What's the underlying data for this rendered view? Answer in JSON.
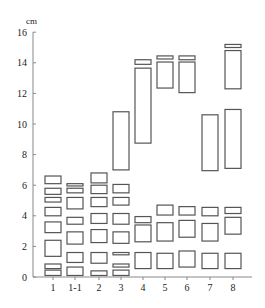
{
  "chart_data": {
    "type": "bar",
    "subtype": "floating-range-boxes",
    "title": "",
    "xlabel": "",
    "ylabel": "cm",
    "ylim": [
      0,
      16
    ],
    "yticks": [
      0,
      2,
      4,
      6,
      8,
      10,
      12,
      14,
      16
    ],
    "grid": false,
    "legend": null,
    "categories": [
      "1",
      "1-1",
      "2",
      "3",
      "4",
      "5",
      "6",
      "7",
      "8"
    ],
    "series": [
      {
        "name": "1",
        "ranges": [
          [
            0.1,
            0.45
          ],
          [
            0.55,
            0.85
          ],
          [
            1.35,
            2.4
          ],
          [
            2.9,
            3.6
          ],
          [
            4.0,
            4.55
          ],
          [
            4.9,
            5.2
          ],
          [
            5.4,
            5.8
          ],
          [
            6.1,
            6.6
          ]
        ]
      },
      {
        "name": "1-1",
        "ranges": [
          [
            0.1,
            0.65
          ],
          [
            0.95,
            1.6
          ],
          [
            2.15,
            2.95
          ],
          [
            3.45,
            3.9
          ],
          [
            4.45,
            5.2
          ],
          [
            5.5,
            5.8
          ],
          [
            5.95,
            6.1
          ]
        ]
      },
      {
        "name": "2",
        "ranges": [
          [
            0.1,
            0.4
          ],
          [
            0.9,
            1.6
          ],
          [
            2.25,
            3.1
          ],
          [
            3.5,
            4.15
          ],
          [
            4.6,
            5.2
          ],
          [
            5.45,
            6.0
          ],
          [
            6.15,
            6.8
          ]
        ]
      },
      {
        "name": "3",
        "ranges": [
          [
            0.1,
            0.45
          ],
          [
            0.65,
            0.85
          ],
          [
            1.45,
            1.6
          ],
          [
            2.2,
            2.95
          ],
          [
            3.45,
            4.15
          ],
          [
            4.7,
            5.2
          ],
          [
            5.5,
            6.05
          ],
          [
            7.0,
            10.8
          ]
        ]
      },
      {
        "name": "4",
        "ranges": [
          [
            0.55,
            1.6
          ],
          [
            2.3,
            3.4
          ],
          [
            3.55,
            3.95
          ],
          [
            8.75,
            13.65
          ],
          [
            13.9,
            14.2
          ]
        ]
      },
      {
        "name": "5",
        "ranges": [
          [
            0.55,
            1.55
          ],
          [
            2.35,
            3.55
          ],
          [
            4.05,
            4.7
          ],
          [
            12.35,
            14.05
          ],
          [
            14.25,
            14.45
          ]
        ]
      },
      {
        "name": "6",
        "ranges": [
          [
            0.65,
            1.7
          ],
          [
            2.6,
            3.7
          ],
          [
            4.05,
            4.6
          ],
          [
            12.05,
            14.05
          ],
          [
            14.2,
            14.45
          ]
        ]
      },
      {
        "name": "7",
        "ranges": [
          [
            0.55,
            1.55
          ],
          [
            2.35,
            3.5
          ],
          [
            4.0,
            4.55
          ],
          [
            6.95,
            10.6
          ]
        ]
      },
      {
        "name": "8",
        "ranges": [
          [
            0.55,
            1.55
          ],
          [
            2.8,
            3.9
          ],
          [
            4.15,
            4.55
          ],
          [
            7.1,
            10.95
          ],
          [
            12.3,
            14.8
          ],
          [
            15.0,
            15.2
          ]
        ]
      }
    ]
  },
  "axes": {
    "y_unit": "cm",
    "y_tick_labels": [
      "0",
      "2",
      "4",
      "6",
      "8",
      "10",
      "12",
      "14",
      "16"
    ],
    "x_tick_labels": [
      "1",
      "1-1",
      "2",
      "3",
      "4",
      "5",
      "6",
      "7",
      "8"
    ]
  },
  "style": {
    "box_stroke": "#555555",
    "axis_color": "#888888",
    "text_color": "#222222"
  }
}
